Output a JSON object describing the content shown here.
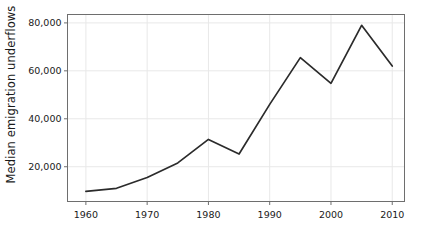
{
  "chart_data": {
    "type": "line",
    "title": "",
    "xlabel": "",
    "ylabel": "Median emigration underflows",
    "x": [
      1960,
      1965,
      1970,
      1975,
      1980,
      1985,
      1990,
      1995,
      2000,
      2005,
      2010
    ],
    "values": [
      9700,
      11000,
      15500,
      21600,
      31400,
      25300,
      46000,
      65500,
      54800,
      79000,
      62000
    ],
    "series": [
      {
        "name": "Median emigration underflows",
        "values": [
          9700,
          11000,
          15500,
          21600,
          31400,
          25300,
          46000,
          65500,
          54800,
          79000,
          62000
        ]
      }
    ],
    "xlim": [
      1957,
      2012
    ],
    "ylim": [
      5500,
      83500
    ],
    "xticks": [
      1960,
      1970,
      1980,
      1990,
      2000,
      2010
    ],
    "xtick_labels": [
      "1960",
      "1970",
      "1980",
      "1990",
      "2000",
      "2010"
    ],
    "yticks": [
      20000,
      40000,
      60000,
      80000
    ],
    "ytick_labels": [
      "20,000",
      "40,000",
      "60,000",
      "80,000"
    ],
    "grid": true,
    "grid_axes": "both",
    "legend": false,
    "legend_position": "none",
    "line_color": "#2b2b2b",
    "grid_color": "#e8e8e8",
    "frame_color": "#6e6e6e",
    "background_color": "#ffffff",
    "markers": false
  },
  "axes": {
    "y_title": "Median emigration underflows"
  }
}
